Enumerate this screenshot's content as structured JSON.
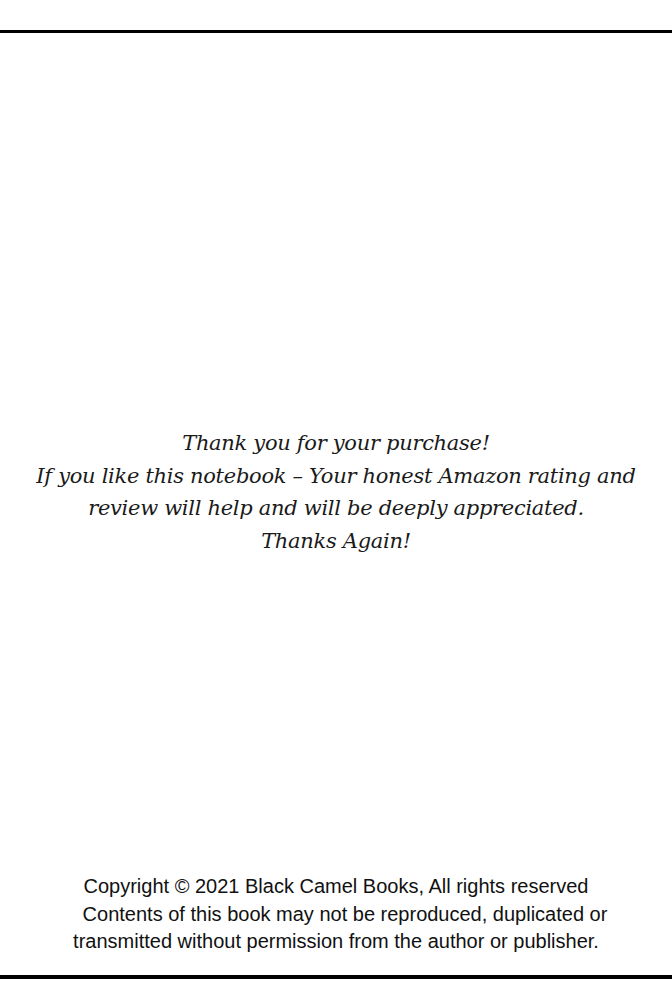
{
  "page": {
    "message": {
      "lines": [
        "Thank you for your purchase!",
        "If you like this notebook  – Your honest Amazon rating and",
        "review will help and will be deeply appreciated.",
        "Thanks Again!"
      ]
    },
    "copyright": {
      "lines": [
        "Copyright © 2021 Black Camel  Books, All rights reserved",
        "Contents of this book may not be reproduced, duplicated or",
        "transmitted without permission from the author or publisher."
      ]
    }
  }
}
